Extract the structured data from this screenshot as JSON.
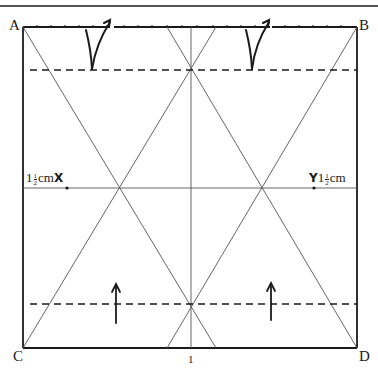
{
  "diagram": {
    "corners": {
      "top_left": "A",
      "top_right": "B",
      "bottom_left": "C",
      "bottom_right": "D"
    },
    "left_measure": {
      "whole": "1",
      "numerator": "1",
      "denominator": "2",
      "unit": "cm",
      "mark": "X"
    },
    "right_measure": {
      "whole": "1",
      "numerator": "1",
      "denominator": "2",
      "unit": "cm",
      "mark": "Y"
    },
    "bottom_center_label": "1",
    "colors": {
      "line": "#1a1a1a",
      "crease": "#555555",
      "background": "#ffffff"
    },
    "arrows": {
      "top": [
        "fold-up-arrow-left",
        "fold-up-arrow-right"
      ],
      "bottom": [
        "push-up-arrow-left",
        "push-up-arrow-right"
      ]
    }
  }
}
